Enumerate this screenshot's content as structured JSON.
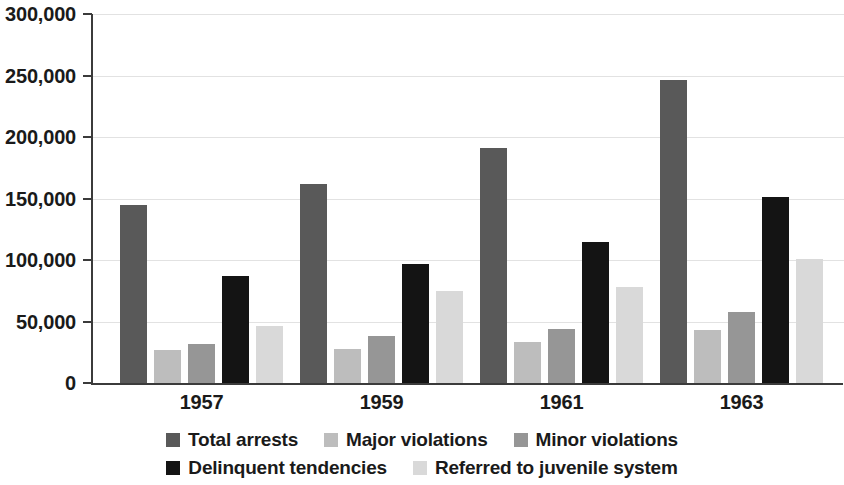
{
  "chart_data": {
    "type": "bar",
    "title": "",
    "subtitle": "",
    "xlabel": "",
    "ylabel": "",
    "categories": [
      "1957",
      "1959",
      "1961",
      "1963"
    ],
    "series": [
      {
        "name": "Total arrests",
        "color": "#595959",
        "values": [
          145000,
          162000,
          191000,
          246000
        ]
      },
      {
        "name": "Major violations",
        "color": "#bdbdbd",
        "values": [
          27000,
          28000,
          33000,
          43000
        ]
      },
      {
        "name": "Minor violations",
        "color": "#969696",
        "values": [
          32000,
          38000,
          44000,
          58000
        ]
      },
      {
        "name": "Delinquent tendencies",
        "color": "#141414",
        "values": [
          87000,
          97000,
          115000,
          151000
        ]
      },
      {
        "name": "Referred to juvenile system",
        "color": "#d9d9d9",
        "values": [
          46000,
          75000,
          78000,
          101000
        ]
      }
    ],
    "ylim": [
      0,
      300000
    ],
    "ytick_values": [
      0,
      50000,
      100000,
      150000,
      200000,
      250000,
      300000
    ],
    "ytick_labels": [
      "0",
      "50,000",
      "100,000",
      "150,000",
      "200,000",
      "250,000",
      "300,000"
    ],
    "grid": true,
    "grid_axis": "y",
    "legend_position": "bottom",
    "legend_rows": [
      [
        "Total arrests",
        "Major violations",
        "Minor violations"
      ],
      [
        "Delinquent tendencies",
        "Referred to juvenile system"
      ]
    ]
  }
}
